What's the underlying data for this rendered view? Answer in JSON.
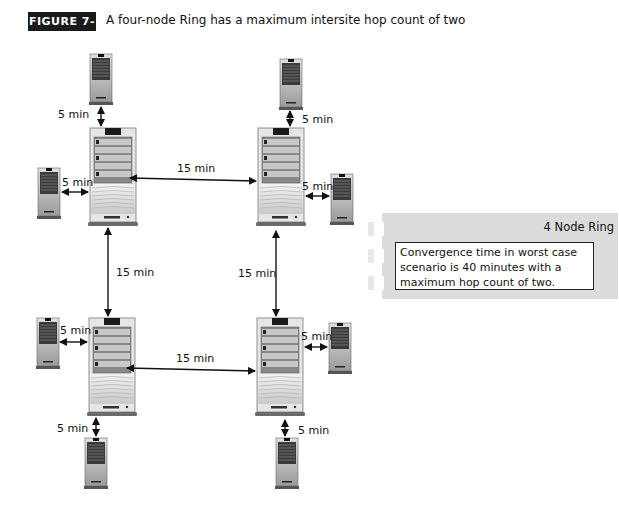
{
  "figure": {
    "badge": "FIGURE 7-17",
    "caption": "A four-node Ring has a maximum intersite hop count of two"
  },
  "nodes": [
    {
      "id": "hub-top-left",
      "type": "server-large"
    },
    {
      "id": "hub-top-right",
      "type": "server-large"
    },
    {
      "id": "hub-bottom-left",
      "type": "server-large"
    },
    {
      "id": "hub-bottom-right",
      "type": "server-large"
    },
    {
      "id": "branch-tl-top",
      "type": "server-small"
    },
    {
      "id": "branch-tl-left",
      "type": "server-small"
    },
    {
      "id": "branch-tr-top",
      "type": "server-small"
    },
    {
      "id": "branch-tr-right",
      "type": "server-small"
    },
    {
      "id": "branch-bl-left",
      "type": "server-small"
    },
    {
      "id": "branch-bl-bottom",
      "type": "server-small"
    },
    {
      "id": "branch-br-right",
      "type": "server-small"
    },
    {
      "id": "branch-br-bottom",
      "type": "server-small"
    }
  ],
  "links": {
    "tl_top": "5 min",
    "tl_left": "5 min",
    "tl_tr": "15 min",
    "tr_top": "5 min",
    "tr_right": "5 min",
    "tl_bl": "15 min",
    "tr_br": "15 min",
    "bl_left": "5 min",
    "bl_br": "15 min",
    "br_right": "5 min",
    "bl_bottom": "5 min",
    "br_bottom": "5 min"
  },
  "legend": {
    "title": "4 Node Ring",
    "text": "Convergence time in worst case scenario is 40 minutes with a maximum hop count of two."
  }
}
